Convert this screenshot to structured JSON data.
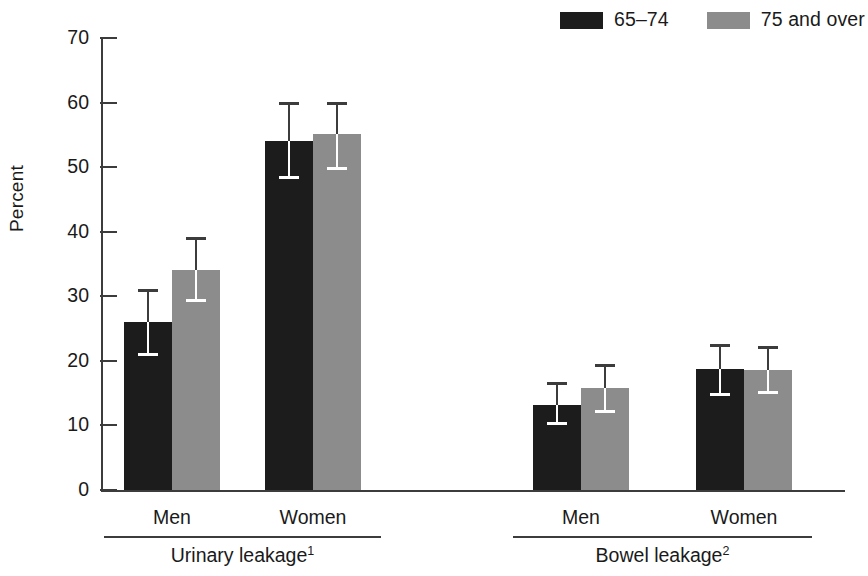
{
  "legend": {
    "entries": [
      {
        "label": "65–74",
        "color": "#1c1c1c",
        "icon": "legend-swatch-dark"
      },
      {
        "label": "75 and over",
        "color": "#8c8c8c",
        "icon": "legend-swatch-gray"
      }
    ]
  },
  "axis": {
    "ylabel": "Percent",
    "yticks": [
      "0",
      "10",
      "20",
      "30",
      "40",
      "50",
      "60",
      "70"
    ]
  },
  "sections": [
    {
      "label": "Urinary leakage",
      "footnote": "1",
      "groups": [
        "Men",
        "Women"
      ]
    },
    {
      "label": "Bowel leakage",
      "footnote": "2",
      "groups": [
        "Men",
        "Women"
      ]
    }
  ],
  "chart_data": {
    "type": "bar",
    "title": "",
    "xlabel": "",
    "ylabel": "Percent",
    "ylim": [
      0,
      70
    ],
    "ytick_step": 10,
    "grid": false,
    "legend_position": "top-right",
    "error_bars": "95% confidence interval",
    "categories": [
      "Urinary leakage – Men",
      "Urinary leakage – Women",
      "Bowel leakage – Men",
      "Bowel leakage – Women"
    ],
    "series": [
      {
        "name": "65–74",
        "color": "#1c1c1c",
        "values": [
          26.0,
          54.0,
          13.2,
          18.7
        ],
        "ci_low": [
          21.0,
          48.5,
          10.4,
          14.8
        ],
        "ci_high": [
          31.0,
          60.0,
          16.5,
          22.5
        ]
      },
      {
        "name": "75 and over",
        "color": "#8c8c8c",
        "values": [
          34.0,
          55.2,
          15.8,
          18.6
        ],
        "ci_low": [
          29.5,
          49.8,
          12.2,
          15.2
        ],
        "ci_high": [
          39.0,
          60.0,
          19.3,
          22.2
        ]
      }
    ]
  }
}
